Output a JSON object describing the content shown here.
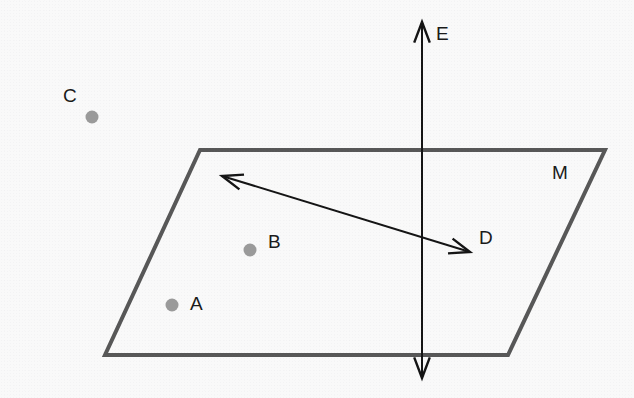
{
  "figure": {
    "kind": "geometry-diagram",
    "background_color": "#f9f9f9",
    "plane_stroke_color": "#575757",
    "plane_stroke_width": 4,
    "line_stroke_color": "#141414",
    "line_stroke_width": 2,
    "dot_fill_color": "#9a9a9a",
    "dot_diameter": 13,
    "label_color": "#1a1a1a",
    "label_font_size": 19
  },
  "plane": {
    "name": "M",
    "label": "M",
    "label_x": 552,
    "label_y": 163,
    "corners": [
      {
        "x": 200,
        "y": 150
      },
      {
        "x": 605,
        "y": 150
      },
      {
        "x": 508,
        "y": 355
      },
      {
        "x": 105,
        "y": 355
      }
    ]
  },
  "points": [
    {
      "id": "A",
      "label": "A",
      "dot_x": 172,
      "dot_y": 305,
      "label_x": 190,
      "label_y": 294,
      "location": "on plane M"
    },
    {
      "id": "B",
      "label": "B",
      "dot_x": 250,
      "dot_y": 250,
      "label_x": 268,
      "label_y": 232,
      "location": "on plane M"
    },
    {
      "id": "C",
      "label": "C",
      "dot_x": 92,
      "dot_y": 117,
      "label_x": 63,
      "label_y": 86,
      "location": "above plane M"
    }
  ],
  "lines": [
    {
      "id": "D",
      "label": "D",
      "label_x": 479,
      "label_y": 228,
      "orientation": "diagonal",
      "arrowheads": "both",
      "from": {
        "x": 222,
        "y": 176
      },
      "to": {
        "x": 470,
        "y": 252
      },
      "location": "lies in plane M"
    },
    {
      "id": "E",
      "label": "E",
      "label_x": 436,
      "label_y": 24,
      "orientation": "vertical",
      "arrowheads": "both",
      "from": {
        "x": 422,
        "y": 22
      },
      "to": {
        "x": 422,
        "y": 378
      },
      "location": "pierces plane M"
    }
  ]
}
